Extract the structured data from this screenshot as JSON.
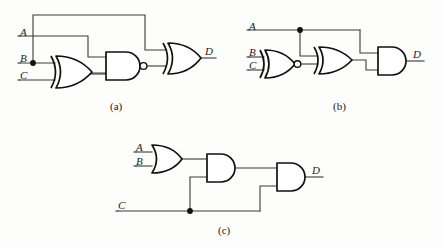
{
  "figure": {
    "panels": [
      {
        "id": "a",
        "caption": "(a)",
        "inputs": [
          {
            "name": "A",
            "label": "A"
          },
          {
            "name": "B",
            "label": "B"
          },
          {
            "name": "C",
            "label": "C"
          }
        ],
        "output": {
          "name": "D",
          "label": "D"
        },
        "gates": [
          {
            "name": "xor-gate-1",
            "type": "XOR",
            "inputs": [
              "B",
              "C"
            ]
          },
          {
            "name": "nand-gate-1",
            "type": "NAND",
            "inputs": [
              "A",
              "xor-gate-1"
            ]
          },
          {
            "name": "xor-gate-2",
            "type": "XOR",
            "inputs": [
              "B",
              "nand-gate-1"
            ]
          }
        ],
        "junctions": [
          "B"
        ]
      },
      {
        "id": "b",
        "caption": "(b)",
        "inputs": [
          {
            "name": "A",
            "label": "A"
          },
          {
            "name": "B",
            "label": "B"
          },
          {
            "name": "C",
            "label": "C"
          }
        ],
        "output": {
          "name": "D",
          "label": "D"
        },
        "gates": [
          {
            "name": "xnor-gate-1",
            "type": "XNOR",
            "inputs": [
              "B",
              "C"
            ]
          },
          {
            "name": "xor-gate-1",
            "type": "XOR",
            "inputs": [
              "A",
              "xnor-gate-1"
            ]
          },
          {
            "name": "and-gate-1",
            "type": "AND",
            "inputs": [
              "A",
              "xor-gate-1"
            ]
          }
        ],
        "junctions": [
          "A"
        ]
      },
      {
        "id": "c",
        "caption": "(c)",
        "inputs": [
          {
            "name": "A",
            "label": "A"
          },
          {
            "name": "B",
            "label": "B"
          },
          {
            "name": "C",
            "label": "C"
          }
        ],
        "output": {
          "name": "D",
          "label": "D"
        },
        "gates": [
          {
            "name": "or-gate-1",
            "type": "OR",
            "inputs": [
              "A",
              "B"
            ]
          },
          {
            "name": "and-gate-1",
            "type": "AND",
            "inputs": [
              "or-gate-1",
              "C"
            ]
          },
          {
            "name": "and-gate-2",
            "type": "AND",
            "inputs": [
              "and-gate-1",
              "C"
            ]
          }
        ],
        "junctions": [
          "C"
        ]
      }
    ],
    "colors": {
      "wire": "#3a3a3a",
      "gate_outline": "#111111",
      "gate_fill": "#ffffff",
      "label": "#1a1a1a",
      "background": "#fdfdfc"
    }
  }
}
